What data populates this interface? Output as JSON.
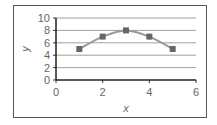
{
  "chart_data": {
    "type": "line",
    "title": "",
    "xlabel": "x",
    "ylabel": "y",
    "x": [
      1,
      2,
      3,
      4,
      5
    ],
    "series": [
      {
        "name": "y",
        "values": [
          5,
          7,
          8,
          7,
          5
        ],
        "color": "#999999",
        "marker": "square",
        "marker_color": "#666666"
      }
    ],
    "xlim": [
      0,
      6
    ],
    "ylim": [
      0,
      10
    ],
    "xticks": [
      0,
      2,
      4,
      6
    ],
    "yticks": [
      0,
      2,
      4,
      6,
      8,
      10
    ],
    "grid": {
      "horizontal": true,
      "vertical": false
    },
    "legend": null
  }
}
